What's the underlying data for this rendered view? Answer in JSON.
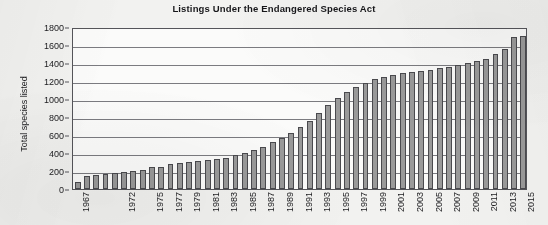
{
  "chart_data": {
    "type": "bar",
    "title": "Listings Under the Endangered Species Act",
    "xlabel": "",
    "ylabel": "Total species listed",
    "ylim": [
      0,
      1800
    ],
    "ytick_step": 200,
    "yticks": [
      0,
      200,
      400,
      600,
      800,
      1000,
      1200,
      1400,
      1600,
      1800
    ],
    "grid": true,
    "legend": false,
    "bar_color": "#9a9a9a",
    "bar_edge_color": "#4a4a4e",
    "categories": [
      "1967",
      "1968",
      "1969",
      "1970",
      "1971",
      "1972",
      "1973",
      "1974",
      "1975",
      "1976",
      "1977",
      "1978",
      "1979",
      "1980",
      "1981",
      "1982",
      "1983",
      "1984",
      "1985",
      "1986",
      "1987",
      "1988",
      "1989",
      "1990",
      "1991",
      "1992",
      "1993",
      "1994",
      "1995",
      "1996",
      "1997",
      "1998",
      "1999",
      "2000",
      "2001",
      "2002",
      "2003",
      "2004",
      "2005",
      "2006",
      "2007",
      "2008",
      "2009",
      "2010",
      "2011",
      "2012",
      "2013",
      "2014",
      "2015"
    ],
    "xtick_labels": [
      "1967",
      "1972",
      "1975",
      "1977",
      "1979",
      "1981",
      "1983",
      "1985",
      "1987",
      "1989",
      "1991",
      "1993",
      "1995",
      "1997",
      "1999",
      "2001",
      "2003",
      "2005",
      "2007",
      "2009",
      "2011",
      "2013",
      "2015"
    ],
    "values": [
      80,
      150,
      160,
      170,
      180,
      190,
      200,
      215,
      240,
      250,
      275,
      290,
      300,
      310,
      320,
      335,
      350,
      375,
      400,
      430,
      470,
      520,
      570,
      620,
      690,
      760,
      840,
      930,
      1010,
      1080,
      1130,
      1180,
      1220,
      1250,
      1270,
      1290,
      1300,
      1310,
      1320,
      1340,
      1360,
      1380,
      1400,
      1420,
      1450,
      1500,
      1560,
      1690,
      1700
    ]
  }
}
